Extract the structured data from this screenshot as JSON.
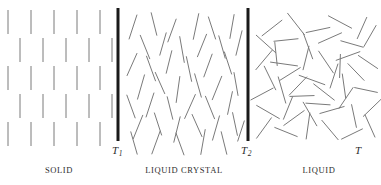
{
  "figure": {
    "width": 381,
    "height": 185,
    "background": "#ffffff"
  },
  "colors": {
    "molecule_stroke": "#7a7a7a",
    "molecule_stroke_dark": "#5e5e5e",
    "boundary_bar": "#1a1a1a",
    "label_text": "#2e2e2e",
    "tick_text": "#2b2b2b"
  },
  "axis": {
    "variable": "T",
    "variable_label": "T",
    "ticks": [
      {
        "id": "T1",
        "label": "T",
        "subscript": "1",
        "x": 118
      },
      {
        "id": "T2",
        "label": "T",
        "subscript": "2",
        "x": 248
      }
    ]
  },
  "boundaries": [
    {
      "name": "transition-bar-T1",
      "x": 118,
      "y_top": 8,
      "y_bottom": 141,
      "width": 3
    },
    {
      "name": "transition-bar-T2",
      "x": 248,
      "y_top": 8,
      "y_bottom": 141,
      "width": 3
    }
  ],
  "phases": [
    {
      "id": "solid",
      "label": "SOLID",
      "order": "positional and orientational order",
      "x_start": 6,
      "x_end": 114,
      "molecule_count": 24
    },
    {
      "id": "liquid-crystal",
      "label": "LIQUID CRYSTAL",
      "order": "orientational order only",
      "x_start": 126,
      "x_end": 244,
      "molecule_count": 48
    },
    {
      "id": "liquid",
      "label": "LIQUID",
      "order": "no long-range order",
      "x_start": 256,
      "x_end": 376,
      "molecule_count": 56
    }
  ],
  "chart_data": {
    "type": "diagram",
    "title": "",
    "xlabel": "T",
    "ylabel": "",
    "categories": [
      "SOLID",
      "LIQUID CRYSTAL",
      "LIQUID"
    ],
    "boundary_labels": [
      "T1",
      "T2"
    ],
    "solid_lattice": {
      "rows": 5,
      "row_y": [
        10,
        38,
        66,
        94,
        122
      ],
      "row_offset_x": [
        8,
        20,
        8,
        20,
        8
      ],
      "col_spacing": 23,
      "cols_per_row": [
        5,
        5,
        5,
        5,
        5
      ],
      "rod_length": 24,
      "rod_angle_deg": 0
    },
    "liquid_crystal_rods": [
      {
        "x": 133,
        "y": 14,
        "len": 26,
        "angle": 18
      },
      {
        "x": 154,
        "y": 12,
        "len": 24,
        "angle": -14
      },
      {
        "x": 172,
        "y": 18,
        "len": 25,
        "angle": 20
      },
      {
        "x": 196,
        "y": 13,
        "len": 27,
        "angle": 12
      },
      {
        "x": 212,
        "y": 16,
        "len": 24,
        "angle": -18
      },
      {
        "x": 232,
        "y": 14,
        "len": 25,
        "angle": 10
      },
      {
        "x": 145,
        "y": 34,
        "len": 26,
        "angle": -22
      },
      {
        "x": 163,
        "y": 32,
        "len": 24,
        "angle": 16
      },
      {
        "x": 182,
        "y": 36,
        "len": 27,
        "angle": -10
      },
      {
        "x": 202,
        "y": 33,
        "len": 25,
        "angle": 22
      },
      {
        "x": 222,
        "y": 35,
        "len": 24,
        "angle": -16
      },
      {
        "x": 239,
        "y": 30,
        "len": 26,
        "angle": 14
      },
      {
        "x": 132,
        "y": 52,
        "len": 25,
        "angle": 24
      },
      {
        "x": 151,
        "y": 55,
        "len": 27,
        "angle": -20
      },
      {
        "x": 169,
        "y": 50,
        "len": 24,
        "angle": 14
      },
      {
        "x": 189,
        "y": 56,
        "len": 26,
        "angle": -12
      },
      {
        "x": 208,
        "y": 53,
        "len": 25,
        "angle": 20
      },
      {
        "x": 228,
        "y": 51,
        "len": 24,
        "angle": -18
      },
      {
        "x": 141,
        "y": 74,
        "len": 26,
        "angle": 16
      },
      {
        "x": 160,
        "y": 71,
        "len": 24,
        "angle": -24
      },
      {
        "x": 178,
        "y": 76,
        "len": 27,
        "angle": 8
      },
      {
        "x": 198,
        "y": 73,
        "len": 25,
        "angle": -16
      },
      {
        "x": 217,
        "y": 75,
        "len": 26,
        "angle": 22
      },
      {
        "x": 236,
        "y": 72,
        "len": 24,
        "angle": -10
      },
      {
        "x": 131,
        "y": 94,
        "len": 25,
        "angle": -20
      },
      {
        "x": 150,
        "y": 92,
        "len": 26,
        "angle": 18
      },
      {
        "x": 170,
        "y": 96,
        "len": 24,
        "angle": -14
      },
      {
        "x": 190,
        "y": 93,
        "len": 27,
        "angle": 24
      },
      {
        "x": 210,
        "y": 95,
        "len": 25,
        "angle": -22
      },
      {
        "x": 230,
        "y": 91,
        "len": 24,
        "angle": 12
      },
      {
        "x": 138,
        "y": 114,
        "len": 26,
        "angle": 22
      },
      {
        "x": 158,
        "y": 112,
        "len": 24,
        "angle": -18
      },
      {
        "x": 177,
        "y": 116,
        "len": 27,
        "angle": 14
      },
      {
        "x": 197,
        "y": 113,
        "len": 25,
        "angle": -24
      },
      {
        "x": 216,
        "y": 115,
        "len": 26,
        "angle": 16
      },
      {
        "x": 235,
        "y": 112,
        "len": 24,
        "angle": -12
      },
      {
        "x": 134,
        "y": 131,
        "len": 24,
        "angle": -16
      },
      {
        "x": 156,
        "y": 130,
        "len": 25,
        "angle": 20
      },
      {
        "x": 180,
        "y": 132,
        "len": 24,
        "angle": -20
      },
      {
        "x": 203,
        "y": 129,
        "len": 26,
        "angle": 10
      },
      {
        "x": 224,
        "y": 131,
        "len": 24,
        "angle": -14
      },
      {
        "x": 241,
        "y": 120,
        "len": 22,
        "angle": 18
      }
    ],
    "liquid_rods": [
      {
        "x": 272,
        "y": 28,
        "len": 26,
        "angle": 52
      },
      {
        "x": 296,
        "y": 24,
        "len": 28,
        "angle": -38
      },
      {
        "x": 318,
        "y": 30,
        "len": 25,
        "angle": 78
      },
      {
        "x": 340,
        "y": 22,
        "len": 27,
        "angle": -62
      },
      {
        "x": 362,
        "y": 28,
        "len": 24,
        "angle": 24
      },
      {
        "x": 266,
        "y": 44,
        "len": 27,
        "angle": -48
      },
      {
        "x": 286,
        "y": 40,
        "len": 25,
        "angle": 84
      },
      {
        "x": 308,
        "y": 46,
        "len": 28,
        "angle": -20
      },
      {
        "x": 330,
        "y": 38,
        "len": 26,
        "angle": 66
      },
      {
        "x": 352,
        "y": 44,
        "len": 24,
        "angle": -74
      },
      {
        "x": 370,
        "y": 36,
        "len": 25,
        "angle": 30
      },
      {
        "x": 264,
        "y": 60,
        "len": 26,
        "angle": 40
      },
      {
        "x": 284,
        "y": 64,
        "len": 28,
        "angle": -82
      },
      {
        "x": 306,
        "y": 58,
        "len": 25,
        "angle": 14
      },
      {
        "x": 326,
        "y": 62,
        "len": 27,
        "angle": -34
      },
      {
        "x": 348,
        "y": 56,
        "len": 26,
        "angle": 70
      },
      {
        "x": 368,
        "y": 62,
        "len": 24,
        "angle": -56
      },
      {
        "x": 270,
        "y": 78,
        "len": 27,
        "angle": -26
      },
      {
        "x": 290,
        "y": 74,
        "len": 25,
        "angle": 58
      },
      {
        "x": 312,
        "y": 80,
        "len": 28,
        "angle": -70
      },
      {
        "x": 334,
        "y": 76,
        "len": 26,
        "angle": 18
      },
      {
        "x": 356,
        "y": 72,
        "len": 24,
        "angle": -44
      },
      {
        "x": 262,
        "y": 94,
        "len": 26,
        "angle": 62
      },
      {
        "x": 282,
        "y": 90,
        "len": 28,
        "angle": -16
      },
      {
        "x": 302,
        "y": 96,
        "len": 25,
        "angle": 88
      },
      {
        "x": 324,
        "y": 92,
        "len": 27,
        "angle": -52
      },
      {
        "x": 346,
        "y": 98,
        "len": 26,
        "angle": 34
      },
      {
        "x": 366,
        "y": 90,
        "len": 24,
        "angle": -78
      },
      {
        "x": 268,
        "y": 112,
        "len": 27,
        "angle": -60
      },
      {
        "x": 288,
        "y": 108,
        "len": 25,
        "angle": 22
      },
      {
        "x": 310,
        "y": 114,
        "len": 28,
        "angle": -30
      },
      {
        "x": 332,
        "y": 110,
        "len": 26,
        "angle": 74
      },
      {
        "x": 354,
        "y": 116,
        "len": 24,
        "angle": -12
      },
      {
        "x": 372,
        "y": 108,
        "len": 25,
        "angle": 46
      },
      {
        "x": 264,
        "y": 128,
        "len": 26,
        "angle": 36
      },
      {
        "x": 286,
        "y": 132,
        "len": 25,
        "angle": -68
      },
      {
        "x": 308,
        "y": 126,
        "len": 27,
        "angle": 8
      },
      {
        "x": 330,
        "y": 130,
        "len": 26,
        "angle": -40
      },
      {
        "x": 352,
        "y": 134,
        "len": 24,
        "angle": 64
      },
      {
        "x": 370,
        "y": 126,
        "len": 25,
        "angle": -24
      },
      {
        "x": 276,
        "y": 54,
        "len": 24,
        "angle": -6
      },
      {
        "x": 298,
        "y": 86,
        "len": 26,
        "angle": 44
      },
      {
        "x": 318,
        "y": 104,
        "len": 25,
        "angle": -86
      },
      {
        "x": 340,
        "y": 66,
        "len": 24,
        "angle": 2
      },
      {
        "x": 294,
        "y": 118,
        "len": 26,
        "angle": 54
      },
      {
        "x": 344,
        "y": 86,
        "len": 25,
        "angle": -8
      }
    ]
  }
}
